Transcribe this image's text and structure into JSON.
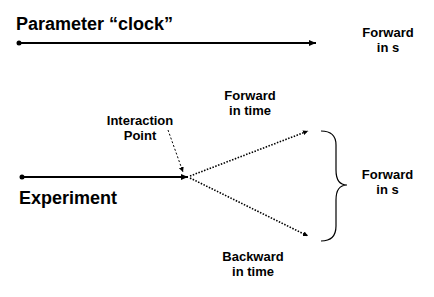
{
  "parameter_clock": {
    "label": "Parameter “clock”",
    "result_line1": "Forward",
    "result_line2": "in s"
  },
  "experiment": {
    "label": "Experiment",
    "interaction_line1": "Interaction",
    "interaction_line2": "Point",
    "forward_time_line1": "Forward",
    "forward_time_line2": "in time",
    "backward_time_line1": "Backward",
    "backward_time_line2": "in time",
    "result_line1": "Forward",
    "result_line2": "in s"
  },
  "colors": {
    "stroke": "#000000",
    "text": "#000000"
  }
}
